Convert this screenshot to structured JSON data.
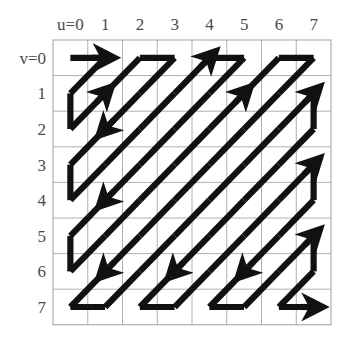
{
  "figure": {
    "kind": "zigzag-scan-order-diagram",
    "background_color": "#ffffff",
    "grid": {
      "columns": 8,
      "rows": 8,
      "left": 53,
      "top": 40,
      "cell_width": 34.75,
      "cell_height": 35.6,
      "line_color": "#b0b0b0",
      "line_width": 1,
      "border_color": "#a0a0a0"
    },
    "path": {
      "color": "#111111",
      "line_width": 6.2,
      "arrow_color": "#111111"
    }
  },
  "axes": {
    "u": {
      "name": "u",
      "origin_label": "u=0",
      "tick_labels": [
        "u=0",
        "1",
        "2",
        "3",
        "4",
        "5",
        "6",
        "7"
      ],
      "values": [
        0,
        1,
        2,
        3,
        4,
        5,
        6,
        7
      ],
      "position": "top",
      "color": "#4a4a4a"
    },
    "v": {
      "name": "v",
      "origin_label": "v=0",
      "tick_labels": [
        "v=0",
        "1",
        "2",
        "3",
        "4",
        "5",
        "6",
        "7"
      ],
      "values": [
        0,
        1,
        2,
        3,
        4,
        5,
        6,
        7
      ],
      "position": "left",
      "color": "#4a4a4a"
    }
  },
  "chart_data": {
    "type": "scatter",
    "title": "",
    "subtitle": "",
    "xlabel": "u",
    "ylabel": "v",
    "xlim": [
      0,
      7
    ],
    "ylim": [
      0,
      7
    ],
    "grid": true,
    "legend": "none",
    "annotations": [
      "u=0",
      "v=0"
    ],
    "scan_order": [
      {
        "index": 0,
        "u": 0,
        "v": 0
      },
      {
        "index": 1,
        "u": 1,
        "v": 0
      },
      {
        "index": 2,
        "u": 0,
        "v": 1
      },
      {
        "index": 3,
        "u": 0,
        "v": 2
      },
      {
        "index": 4,
        "u": 1,
        "v": 1
      },
      {
        "index": 5,
        "u": 2,
        "v": 0
      },
      {
        "index": 6,
        "u": 3,
        "v": 0
      },
      {
        "index": 7,
        "u": 2,
        "v": 1
      },
      {
        "index": 8,
        "u": 1,
        "v": 2
      },
      {
        "index": 9,
        "u": 0,
        "v": 3
      },
      {
        "index": 10,
        "u": 0,
        "v": 4
      },
      {
        "index": 11,
        "u": 1,
        "v": 3
      },
      {
        "index": 12,
        "u": 2,
        "v": 2
      },
      {
        "index": 13,
        "u": 3,
        "v": 1
      },
      {
        "index": 14,
        "u": 4,
        "v": 0
      },
      {
        "index": 15,
        "u": 5,
        "v": 0
      },
      {
        "index": 16,
        "u": 4,
        "v": 1
      },
      {
        "index": 17,
        "u": 3,
        "v": 2
      },
      {
        "index": 18,
        "u": 2,
        "v": 3
      },
      {
        "index": 19,
        "u": 1,
        "v": 4
      },
      {
        "index": 20,
        "u": 0,
        "v": 5
      },
      {
        "index": 21,
        "u": 0,
        "v": 6
      },
      {
        "index": 22,
        "u": 1,
        "v": 5
      },
      {
        "index": 23,
        "u": 2,
        "v": 4
      },
      {
        "index": 24,
        "u": 3,
        "v": 3
      },
      {
        "index": 25,
        "u": 4,
        "v": 2
      },
      {
        "index": 26,
        "u": 5,
        "v": 1
      },
      {
        "index": 27,
        "u": 6,
        "v": 0
      },
      {
        "index": 28,
        "u": 7,
        "v": 0
      },
      {
        "index": 29,
        "u": 6,
        "v": 1
      },
      {
        "index": 30,
        "u": 5,
        "v": 2
      },
      {
        "index": 31,
        "u": 4,
        "v": 3
      },
      {
        "index": 32,
        "u": 3,
        "v": 4
      },
      {
        "index": 33,
        "u": 2,
        "v": 5
      },
      {
        "index": 34,
        "u": 1,
        "v": 6
      },
      {
        "index": 35,
        "u": 0,
        "v": 7
      },
      {
        "index": 36,
        "u": 1,
        "v": 7
      },
      {
        "index": 37,
        "u": 2,
        "v": 6
      },
      {
        "index": 38,
        "u": 3,
        "v": 5
      },
      {
        "index": 39,
        "u": 4,
        "v": 4
      },
      {
        "index": 40,
        "u": 5,
        "v": 3
      },
      {
        "index": 41,
        "u": 6,
        "v": 2
      },
      {
        "index": 42,
        "u": 7,
        "v": 1
      },
      {
        "index": 43,
        "u": 7,
        "v": 2
      },
      {
        "index": 44,
        "u": 6,
        "v": 3
      },
      {
        "index": 45,
        "u": 5,
        "v": 4
      },
      {
        "index": 46,
        "u": 4,
        "v": 5
      },
      {
        "index": 47,
        "u": 3,
        "v": 6
      },
      {
        "index": 48,
        "u": 2,
        "v": 7
      },
      {
        "index": 49,
        "u": 3,
        "v": 7
      },
      {
        "index": 50,
        "u": 4,
        "v": 6
      },
      {
        "index": 51,
        "u": 5,
        "v": 5
      },
      {
        "index": 52,
        "u": 6,
        "v": 4
      },
      {
        "index": 53,
        "u": 7,
        "v": 3
      },
      {
        "index": 54,
        "u": 7,
        "v": 4
      },
      {
        "index": 55,
        "u": 6,
        "v": 5
      },
      {
        "index": 56,
        "u": 5,
        "v": 6
      },
      {
        "index": 57,
        "u": 4,
        "v": 7
      },
      {
        "index": 58,
        "u": 5,
        "v": 7
      },
      {
        "index": 59,
        "u": 6,
        "v": 6
      },
      {
        "index": 60,
        "u": 7,
        "v": 5
      },
      {
        "index": 61,
        "u": 7,
        "v": 6
      },
      {
        "index": 62,
        "u": 6,
        "v": 7
      },
      {
        "index": 63,
        "u": 7,
        "v": 7
      }
    ],
    "arrow_heads_at_indices": [
      1,
      4,
      8,
      14,
      19,
      26,
      34,
      42,
      47,
      53,
      56,
      60,
      63
    ]
  }
}
